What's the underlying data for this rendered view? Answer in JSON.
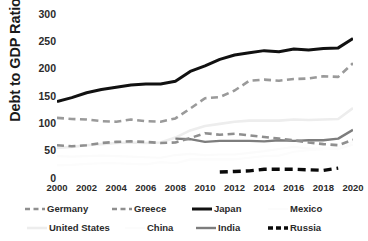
{
  "chart_data": {
    "type": "line",
    "title": "",
    "xlabel": "",
    "ylabel": "Debt to GDP Ratio",
    "xlim": [
      2000,
      2020
    ],
    "ylim": [
      0,
      300
    ],
    "yticks": [
      0,
      50,
      100,
      150,
      200,
      250,
      300
    ],
    "xticks": [
      2000,
      2002,
      2004,
      2006,
      2008,
      2010,
      2012,
      2014,
      2016,
      2018,
      2020
    ],
    "x": [
      2000,
      2001,
      2002,
      2003,
      2004,
      2005,
      2006,
      2007,
      2008,
      2009,
      2010,
      2011,
      2012,
      2013,
      2014,
      2015,
      2016,
      2017,
      2018,
      2019,
      2020
    ],
    "grid": false,
    "legend_position": "bottom",
    "series": [
      {
        "name": "Germany",
        "style": "dashed",
        "color": "#8f8f8f",
        "width": 2.6,
        "values": [
          60,
          58,
          60,
          64,
          66,
          67,
          66,
          64,
          65,
          73,
          82,
          79,
          81,
          78,
          75,
          72,
          69,
          65,
          62,
          60,
          70
        ]
      },
      {
        "name": "Greece",
        "style": "dashed",
        "color": "#9a9a9a",
        "width": 2.6,
        "values": [
          110,
          108,
          107,
          104,
          103,
          107,
          104,
          103,
          109,
          127,
          146,
          148,
          160,
          178,
          180,
          178,
          181,
          182,
          186,
          185,
          210
        ]
      },
      {
        "name": "Japan",
        "style": "solid",
        "color": "#111111",
        "width": 3.0,
        "values": [
          140,
          147,
          156,
          162,
          166,
          170,
          172,
          172,
          177,
          195,
          205,
          217,
          225,
          229,
          233,
          231,
          236,
          234,
          237,
          238,
          255
        ]
      },
      {
        "name": "Mexico",
        "style": "solid",
        "color": "#fbfbfb",
        "width": 2.2,
        "values": [
          40,
          39,
          40,
          41,
          40,
          39,
          38,
          37,
          42,
          44,
          42,
          43,
          43,
          46,
          49,
          53,
          57,
          54,
          54,
          53,
          61
        ]
      },
      {
        "name": "United States",
        "style": "solid",
        "color": "#ededed",
        "width": 2.6,
        "values": [
          55,
          57,
          60,
          62,
          64,
          65,
          64,
          65,
          74,
          87,
          95,
          99,
          103,
          105,
          105,
          105,
          107,
          106,
          107,
          108,
          128
        ]
      },
      {
        "name": "China",
        "style": "solid",
        "color": "#fcfcfc",
        "width": 2.2,
        "values": [
          23,
          24,
          26,
          27,
          27,
          26,
          25,
          29,
          27,
          34,
          34,
          34,
          34,
          37,
          40,
          41,
          48,
          51,
          53,
          57,
          66
        ]
      },
      {
        "name": "India",
        "style": "solid",
        "color": "#7d7d7d",
        "width": 2.4,
        "values": [
          null,
          null,
          null,
          null,
          null,
          null,
          null,
          null,
          72,
          71,
          66,
          68,
          68,
          68,
          67,
          69,
          68,
          69,
          69,
          72,
          88
        ]
      },
      {
        "name": "Russia",
        "style": "dashed-thick",
        "color": "#0a0a0a",
        "width": 3.4,
        "values": [
          null,
          null,
          null,
          null,
          null,
          null,
          null,
          null,
          null,
          null,
          null,
          11,
          12,
          13,
          16,
          16,
          16,
          15,
          14,
          18,
          null
        ]
      }
    ]
  },
  "axis": {
    "ylabel": "Debt to GDP Ratio",
    "yticks": [
      "300",
      "250",
      "200",
      "150",
      "100",
      "50",
      "0"
    ],
    "xticks": [
      "2000",
      "2002",
      "2004",
      "2006",
      "2008",
      "2010",
      "2012",
      "2014",
      "2016",
      "2018",
      "2020"
    ]
  },
  "legend": {
    "row1": [
      {
        "label": "Germany",
        "swatch": "dashed-gray-line-icon"
      },
      {
        "label": "Greece",
        "swatch": "dashed-gray-line-icon"
      },
      {
        "label": "Japan",
        "swatch": "solid-black-line-icon"
      },
      {
        "label": "Mexico",
        "swatch": "solid-white-line-icon"
      }
    ],
    "row2": [
      {
        "label": "United States",
        "swatch": "solid-lightgray-line-icon"
      },
      {
        "label": "China",
        "swatch": "solid-white-line-icon"
      },
      {
        "label": "India",
        "swatch": "solid-gray-line-icon"
      },
      {
        "label": "Russia",
        "swatch": "dashed-black-thick-line-icon"
      }
    ]
  }
}
